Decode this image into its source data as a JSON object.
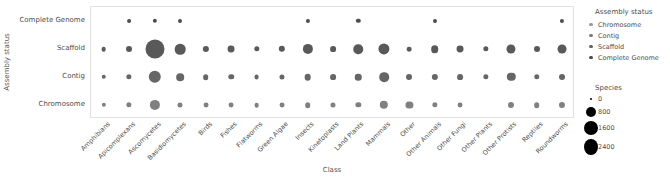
{
  "chart_data": {
    "type": "scatter",
    "title": "",
    "xlabel": "Class",
    "ylabel": "Assembly status",
    "grid": false,
    "legend_position": "right",
    "size_encoding": "Species",
    "color_encoding": "Assembly status",
    "categories": [
      "Amphibians",
      "Apicomplexans",
      "Ascomycetes",
      "Basidiomycetes",
      "Birds",
      "Fishes",
      "Flatworms",
      "Green Algae",
      "Insects",
      "Kinetoplasts",
      "Land Plants",
      "Mammals",
      "Other",
      "Other Animals",
      "Other Fungi",
      "Other Plants",
      "Other Protists",
      "Reptiles",
      "Roundworms"
    ],
    "y_categories": [
      "Complete Genome",
      "Scaffold",
      "Contig",
      "Chromosome"
    ],
    "series": [
      {
        "name": "Complete Genome",
        "color": "#4d4d4d",
        "values": [
          0,
          30,
          45,
          35,
          0,
          0,
          0,
          0,
          40,
          0,
          45,
          0,
          0,
          35,
          0,
          0,
          0,
          0,
          40
        ]
      },
      {
        "name": "Scaffold",
        "color": "#595959",
        "values": [
          60,
          130,
          2400,
          620,
          150,
          200,
          95,
          160,
          560,
          120,
          470,
          700,
          60,
          260,
          200,
          90,
          420,
          130,
          400
        ]
      },
      {
        "name": "Contig",
        "color": "#666666",
        "values": [
          50,
          90,
          900,
          260,
          110,
          100,
          70,
          80,
          180,
          120,
          170,
          480,
          130,
          150,
          120,
          90,
          340,
          100,
          130
        ]
      },
      {
        "name": "Chromosome",
        "color": "#808080",
        "values": [
          45,
          90,
          560,
          80,
          70,
          70,
          60,
          70,
          110,
          80,
          90,
          340,
          220,
          90,
          70,
          0,
          140,
          110,
          140
        ]
      }
    ],
    "size_legend": {
      "title": "Species",
      "ticks": [
        0,
        800,
        1600,
        2400
      ]
    },
    "color_legend": {
      "title": "Assembly status",
      "entries": [
        {
          "label": "Chromosome",
          "color": "#9a9a9a"
        },
        {
          "label": "Contig",
          "color": "#7d7d7d"
        },
        {
          "label": "Scaffold",
          "color": "#646464"
        },
        {
          "label": "Complete Genome",
          "color": "#4a4a4a"
        }
      ]
    }
  }
}
